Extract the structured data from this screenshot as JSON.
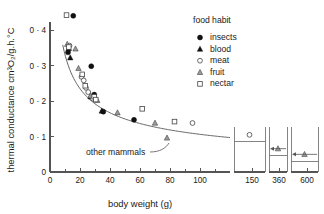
{
  "chart_data": {
    "type": "scatter",
    "title": "",
    "xlabel": "body weight (g)",
    "ylabel": "thermal conductance cm³O₂/g.h.°C",
    "xlim": [
      0,
      120
    ],
    "ylim": [
      0,
      0.45
    ],
    "grid": false,
    "x_ticks": [
      "0",
      "20",
      "40",
      "60",
      "80",
      "100"
    ],
    "x_tick_values": [
      0,
      20,
      40,
      60,
      80,
      100
    ],
    "y_ticks": [
      "0",
      "0 · 1",
      "0 · 2",
      "0 · 3",
      "0 · 4"
    ],
    "y_tick_values": [
      0,
      0.1,
      0.2,
      0.3,
      0.4
    ],
    "broken_axis_ticks": [
      "150",
      "360",
      "600"
    ],
    "broken_axis_values": [
      150,
      360,
      600
    ],
    "legend_position": "top-right",
    "legend_title": "food habit",
    "series": [
      {
        "name": "insects",
        "marker": "filled-circle",
        "color": "#111111",
        "points": [
          [
            15.5,
            0.44
          ],
          [
            12.0,
            0.337
          ],
          [
            27.5,
            0.298
          ],
          [
            29.5,
            0.218
          ],
          [
            35.5,
            0.17
          ],
          [
            56.0,
            0.147
          ]
        ]
      },
      {
        "name": "blood",
        "marker": "filled-triangle",
        "color": "#111111",
        "points": [
          [
            12.5,
            0.348
          ],
          [
            13.5,
            0.322
          ],
          [
            27.0,
            0.212
          ],
          [
            34.5,
            0.172
          ]
        ]
      },
      {
        "name": "meat",
        "marker": "open-circle",
        "color": "#444444",
        "points": [
          [
            13.0,
            0.356
          ],
          [
            21.0,
            0.268
          ],
          [
            22.5,
            0.258
          ],
          [
            24.0,
            0.237
          ],
          [
            25.5,
            0.225
          ],
          [
            28.5,
            0.207
          ],
          [
            95.0,
            0.138
          ],
          [
            150.0,
            0.085
          ]
        ]
      },
      {
        "name": "fruit",
        "marker": "half-triangle",
        "color": "#999999",
        "points": [
          [
            11.5,
            0.36
          ],
          [
            17.0,
            0.347
          ],
          [
            19.0,
            0.292
          ],
          [
            27.0,
            0.215
          ],
          [
            31.5,
            0.202
          ],
          [
            45.0,
            0.167
          ],
          [
            70.0,
            0.138
          ],
          [
            78.0,
            0.096
          ],
          [
            360.0,
            0.046
          ]
        ]
      },
      {
        "name": "nectar",
        "marker": "open-square",
        "color": "#444444",
        "points": [
          [
            11.0,
            0.442
          ],
          [
            12.5,
            0.352
          ],
          [
            21.5,
            0.275
          ],
          [
            23.5,
            0.243
          ],
          [
            29.5,
            0.212
          ],
          [
            30.5,
            0.204
          ],
          [
            61.5,
            0.178
          ],
          [
            83.0,
            0.142
          ]
        ]
      }
    ],
    "fit_curve": {
      "name": "other mammals",
      "annotation": "other mammals",
      "x_start": 8.5,
      "x_end": 120.0,
      "y_at_x_start": 0.358,
      "y_at_x_end": 0.097,
      "form": "power-law decay"
    },
    "broken_panels": [
      {
        "tick": "150",
        "value": 150,
        "y": 0.085,
        "marker": "open-circle",
        "arrow": false
      },
      {
        "tick": "360",
        "value": 360,
        "y": 0.046,
        "marker": "half-triangle",
        "arrow": true
      },
      {
        "tick": "600",
        "value": 600,
        "y": 0.03,
        "marker": "half-triangle",
        "arrow": true
      }
    ]
  },
  "legend": {
    "title": "food habit",
    "entries": [
      {
        "label": "insects",
        "marker": "filled-circle-icon"
      },
      {
        "label": "blood",
        "marker": "filled-triangle-icon"
      },
      {
        "label": "meat",
        "marker": "open-circle-icon"
      },
      {
        "label": "fruit",
        "marker": "half-triangle-icon"
      },
      {
        "label": "nectar",
        "marker": "open-square-icon"
      }
    ]
  },
  "axes": {
    "x_title": "body weight (g)",
    "y_title": "thermal conductance cm³O₂/g.h.°C"
  },
  "annotations": {
    "curve_label": "other mammals"
  },
  "ticks": {
    "y": [
      "0 · 4",
      "0 · 3",
      "0 · 2",
      "0 · 1",
      "0"
    ],
    "x": [
      "0",
      "20",
      "40",
      "60",
      "80",
      "100"
    ],
    "x_broken": [
      "150",
      "360",
      "600"
    ]
  },
  "colors": {
    "axis": "#555555",
    "curve": "#555555",
    "filled_marker": "#111111",
    "open_marker": "#444444",
    "half_marker": "#999999",
    "background": "#ffffff"
  }
}
